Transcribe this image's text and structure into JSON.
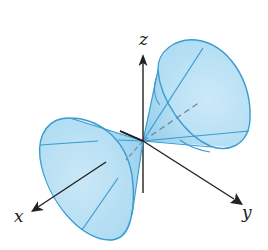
{
  "figure": {
    "axes": {
      "x": {
        "label": "x"
      },
      "y": {
        "label": "y"
      },
      "z": {
        "label": "z"
      }
    },
    "colors": {
      "cone_fill": "#a9d8f0",
      "cone_edge": "#3a9bd0",
      "axis": "#222222",
      "dashed_axis": "#7a8a96"
    },
    "elements": [
      "upper-right cone nappe",
      "lower-left cone nappe",
      "x-axis arrow",
      "y-axis arrow",
      "z-axis arrow",
      "dashed cone axis"
    ]
  }
}
